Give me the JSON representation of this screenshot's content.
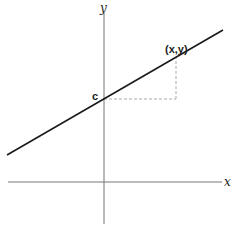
{
  "diagram": {
    "type": "line-graph",
    "labels": {
      "x_axis": "x",
      "y_axis": "y",
      "intercept": "c",
      "point": "(x,y)"
    },
    "colors": {
      "line": "#1a1a1a",
      "axes": "#777777",
      "dashed": "#aaaaaa",
      "background": "#ffffff"
    }
  }
}
